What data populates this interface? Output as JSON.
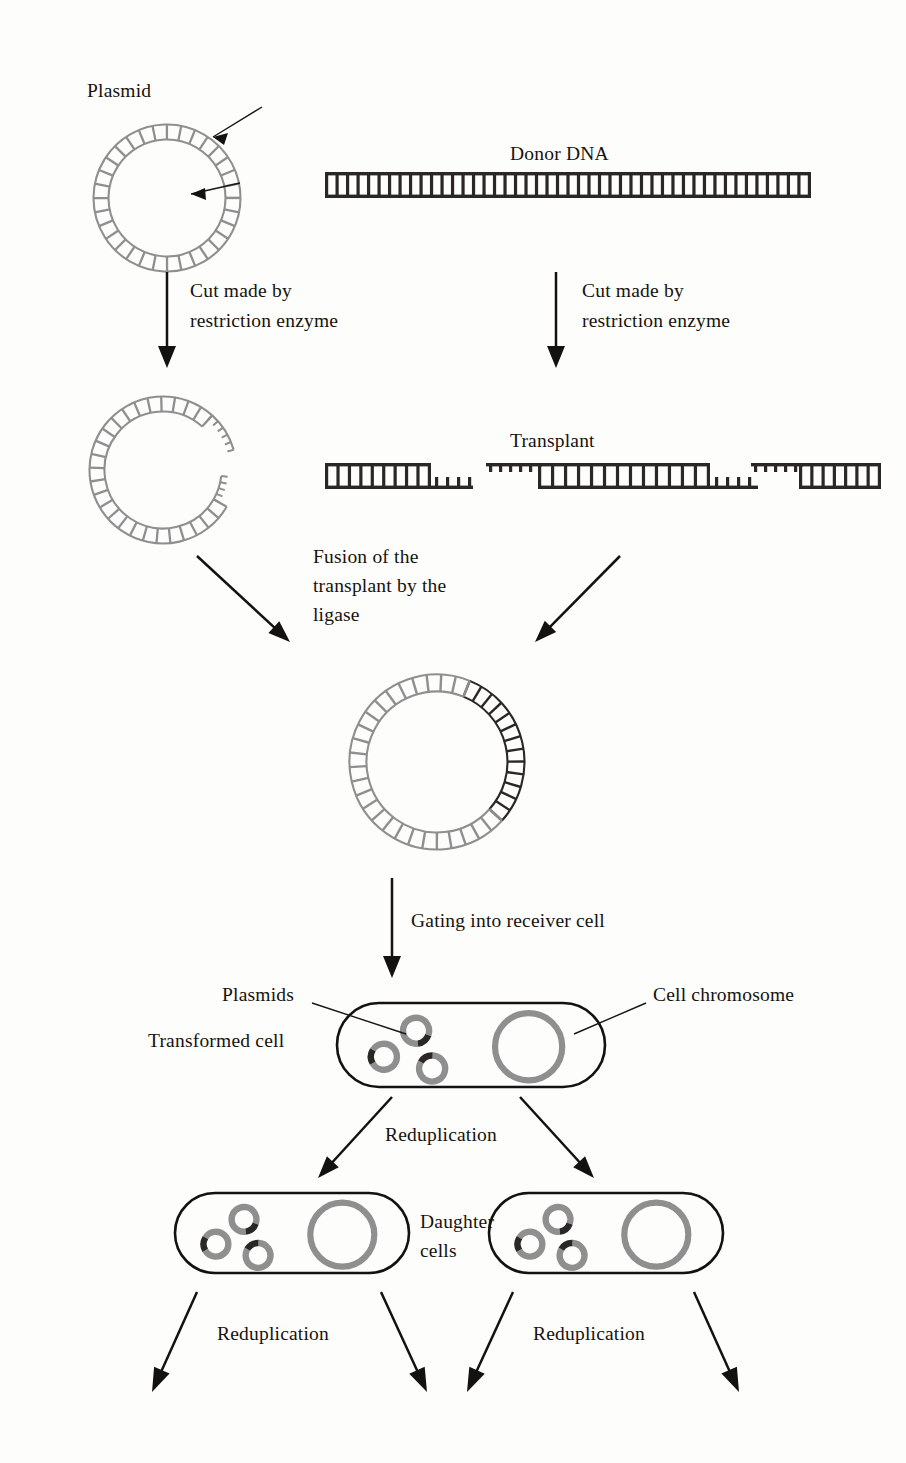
{
  "figure": {
    "type": "diagram",
    "background_color": "#fdfdfc",
    "plasmid_color": "#8f8f8f",
    "donor_dna_color": "#2a2724",
    "outline_color": "#141210"
  },
  "labels": {
    "plasmid": "Plasmid",
    "donor_dna": "Donor DNA",
    "cut_left_line1": "Cut made by",
    "cut_left_line2": "restriction enzyme",
    "cut_right_line1": "Cut made by",
    "cut_right_line2": "restriction enzyme",
    "transplant": "Transplant",
    "fusion_line1": "Fusion of the",
    "fusion_line2": "transplant by the",
    "fusion_line3": "ligase",
    "gating": "Gating into receiver cell",
    "plasmids": "Plasmids",
    "cell_chromosome": "Cell chromosome",
    "transformed_cell": "Transformed cell",
    "reduplication_top": "Reduplication",
    "daughter_line1": "Daughter",
    "daughter_line2": "cells",
    "reduplication_left": "Reduplication",
    "reduplication_right": "Reduplication"
  },
  "structures": {
    "intact_plasmid": {
      "name": "intact-plasmid-ring",
      "cx": 167,
      "cy": 198,
      "r": 66,
      "segments": 32,
      "color": "#8f8f8f",
      "cut_arrows": 2
    },
    "donor_dna": {
      "name": "donor-dna-strand",
      "x": 325,
      "y": 172,
      "width": 486,
      "height": 26,
      "rungs": 46,
      "color": "#2a2724"
    },
    "cut_plasmid": {
      "name": "cut-plasmid-open-ring",
      "cx": 163,
      "cy": 470,
      "r": 66,
      "gap_start_deg": -48,
      "gap_end_deg": 30,
      "color": "#8f8f8f",
      "sticky_ends": 2
    },
    "dna_fragments": [
      {
        "name": "fragment-left",
        "x": 325,
        "y": 463,
        "body_width": 106,
        "tail_width": 42,
        "tail_side": "right-bottom"
      },
      {
        "name": "fragment-transplant",
        "x": 486,
        "y": 463,
        "head_width": 52,
        "body_width": 172,
        "tail_width": 48
      },
      {
        "name": "fragment-right",
        "x": 751,
        "y": 463,
        "head_width": 48,
        "body_width": 82
      }
    ],
    "recombinant_plasmid": {
      "name": "recombinant-plasmid-ring",
      "cx": 437,
      "cy": 762,
      "r": 79,
      "segments": 36,
      "plasmid_arc_deg": [
        40,
        295
      ],
      "insert_arc_deg": [
        -65,
        40
      ],
      "plasmid_color": "#8f8f8f",
      "insert_color": "#2a2724"
    },
    "transformed_cell": {
      "name": "transformed-cell",
      "x": 337,
      "y": 1003,
      "width": 268,
      "height": 84,
      "plasmid_count": 3,
      "chromosome": true
    },
    "daughter_cells": [
      {
        "name": "daughter-cell-left",
        "x": 175,
        "y": 1193,
        "width": 234,
        "height": 80,
        "plasmid_count": 3,
        "chromosome": true
      },
      {
        "name": "daughter-cell-right",
        "x": 489,
        "y": 1193,
        "width": 234,
        "height": 80,
        "plasmid_count": 3,
        "chromosome": true
      }
    ]
  },
  "arrows": {
    "cut_plasmid_arrow": {
      "name": "arrow-cut-plasmid",
      "x1": 167,
      "y1": 272,
      "x2": 167,
      "y2": 368
    },
    "cut_donor_arrow": {
      "name": "arrow-cut-donor",
      "x1": 556,
      "y1": 272,
      "x2": 556,
      "y2": 368
    },
    "fusion_left_arrow": {
      "name": "arrow-fusion-left",
      "x1": 197,
      "y1": 556,
      "x2": 290,
      "y2": 642
    },
    "fusion_right_arrow": {
      "name": "arrow-fusion-right",
      "x1": 620,
      "y1": 556,
      "x2": 535,
      "y2": 642
    },
    "gating_arrow": {
      "name": "arrow-gating",
      "x1": 392,
      "y1": 878,
      "x2": 392,
      "y2": 978
    },
    "reduplication_left_arrow": {
      "name": "arrow-reduplication-left",
      "x1": 392,
      "y1": 1097,
      "x2": 318,
      "y2": 1178
    },
    "reduplication_right_arrow": {
      "name": "arrow-reduplication-right",
      "x1": 520,
      "y1": 1097,
      "x2": 594,
      "y2": 1178
    },
    "bottom_arrows": [
      {
        "name": "arrow-bottom-1",
        "x1": 197,
        "y1": 1292,
        "x2": 152,
        "y2": 1392
      },
      {
        "name": "arrow-bottom-2",
        "x1": 381,
        "y1": 1292,
        "x2": 427,
        "y2": 1392
      },
      {
        "name": "arrow-bottom-3",
        "x1": 513,
        "y1": 1292,
        "x2": 467,
        "y2": 1392
      },
      {
        "name": "arrow-bottom-4",
        "x1": 694,
        "y1": 1292,
        "x2": 739,
        "y2": 1392
      }
    ]
  }
}
